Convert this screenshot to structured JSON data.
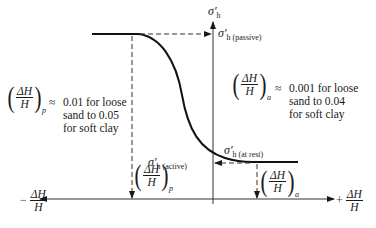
{
  "diagram": {
    "type": "lateral-earth-pressure-vs-wall-tilt",
    "y_axis": {
      "label_symbol": "σ′",
      "label_sub": "h"
    },
    "x_axis": {
      "negative_label_sign": "−",
      "positive_label_sign": "+",
      "label_num": "ΔH",
      "label_den": "H"
    },
    "points": {
      "passive": {
        "symbol": "σ′",
        "sub": "h",
        "qualifier": "(passive)"
      },
      "at_rest": {
        "symbol": "σ′",
        "sub": "h",
        "qualifier": "(at rest)"
      },
      "active": {
        "symbol": "σ′",
        "sub": "h",
        "qualifier": "(active)"
      }
    },
    "strain_markers": {
      "passive": {
        "num": "ΔH",
        "den": "H",
        "sub": "p"
      },
      "active": {
        "num": "ΔH",
        "den": "H",
        "sub": "a"
      }
    },
    "notes": {
      "passive": {
        "num": "ΔH",
        "den": "H",
        "sub": "p",
        "approx": "≈",
        "lines": [
          "0.01 for loose",
          "sand to 0.05",
          "for soft clay"
        ]
      },
      "active": {
        "num": "ΔH",
        "den": "H",
        "sub": "a",
        "approx": "≈",
        "lines": [
          "0.001 for loose",
          "sand to 0.04",
          "for soft clay"
        ]
      }
    }
  }
}
